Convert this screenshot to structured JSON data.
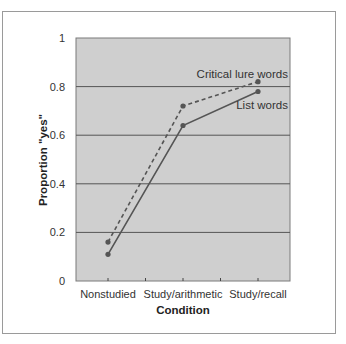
{
  "chart_data": {
    "type": "line",
    "title": "",
    "xlabel": "Condition",
    "ylabel": "Proportion \"yes\"",
    "categories": [
      "Nonstudied",
      "Study/arithmetic",
      "Study/recall"
    ],
    "series": [
      {
        "name": "Critical lure words",
        "style": "dashed",
        "values": [
          0.16,
          0.72,
          0.82
        ]
      },
      {
        "name": "List words",
        "style": "solid",
        "values": [
          0.11,
          0.64,
          0.78
        ]
      }
    ],
    "ylim": [
      0,
      1
    ],
    "yticks": [
      "0",
      "0.2",
      "0.4",
      "0.6",
      "0.8",
      "1"
    ],
    "grid": true,
    "legend": "inline labels near series ends",
    "colors": {
      "plot_bg": "#cfcfcf",
      "line": "#555555",
      "grid": "#555555"
    }
  }
}
